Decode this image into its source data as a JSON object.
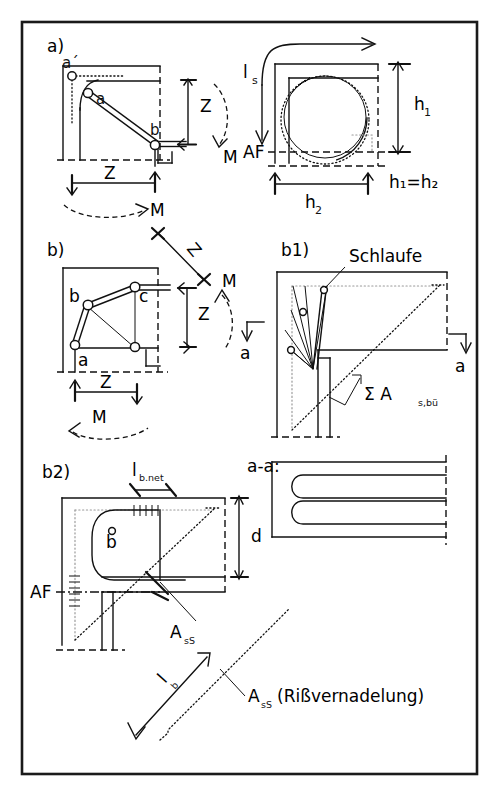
{
  "figure": {
    "border_color": "#1a1a1a",
    "ink_color": "#111111",
    "background": "#ffffff"
  },
  "panels": {
    "a": {
      "label": "a)",
      "left_detail": {
        "nodes": [
          "a´",
          "a",
          "b"
        ],
        "dim_vertical": "Z",
        "dim_horizontal": "Z",
        "moment_right": "M",
        "moment_bottom": "M"
      },
      "right_detail": {
        "loop_length": "l",
        "loop_length_sub": "s",
        "datum": "AF",
        "dim_vertical": "h",
        "dim_vertical_sub": "1",
        "dim_horizontal": "h",
        "dim_horizontal_sub": "2",
        "relation": "h₁=h₂"
      }
    },
    "b": {
      "label": "b)",
      "nodes": [
        "b",
        "c",
        "a"
      ],
      "dim_diagonal": "Z",
      "dim_vertical": "Z",
      "dim_horizontal": "Z",
      "moment_right": "M",
      "moment_bottom": "M"
    },
    "b1": {
      "label": "b1)",
      "callout_loop": "Schlaufe",
      "section_mark_left": "a",
      "section_mark_right": "a",
      "stirrup_sum": "Σ A",
      "stirrup_sum_sub": "s,bü"
    },
    "b2": {
      "label": "b2)",
      "anchorage_length": "l",
      "anchorage_length_sub": "b.net",
      "node": "b",
      "datum": "AF",
      "cross_bar": "A",
      "cross_bar_sub": "sS",
      "bond_length": "l",
      "bond_length_sub": "b",
      "crack_needle": "A",
      "crack_needle_sub": "sS",
      "crack_needle_note": "(Rißvernadelung)"
    },
    "section_aa": {
      "label": "a-a:",
      "depth_dim": "d"
    }
  }
}
